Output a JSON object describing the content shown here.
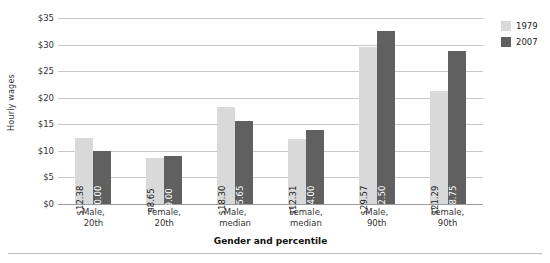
{
  "chart_data": {
    "type": "bar",
    "title": "",
    "xlabel": "Gender and percentile",
    "ylabel": "Hourly wages",
    "ylim": [
      0,
      35
    ],
    "yticks": [
      "$0",
      "$5",
      "$10",
      "$15",
      "$20",
      "$25",
      "$30",
      "$35"
    ],
    "ytick_values": [
      0,
      5,
      10,
      15,
      20,
      25,
      30,
      35
    ],
    "grid": true,
    "legend_position": "top-right",
    "categories": [
      "Male,\n20th",
      "Female,\n20th",
      "Male,\nmedian",
      "Female,\nmedian",
      "Male,\n90th",
      "Female,\n90th"
    ],
    "category_lines": [
      [
        "Male,",
        "20th"
      ],
      [
        "Female,",
        "20th"
      ],
      [
        "Male,",
        "median"
      ],
      [
        "Female,",
        "median"
      ],
      [
        "Male,",
        "90th"
      ],
      [
        "Female,",
        "90th"
      ]
    ],
    "series": [
      {
        "name": "1979",
        "color": "#d9d9d9",
        "values": [
          12.38,
          8.65,
          18.3,
          12.31,
          29.57,
          21.29
        ],
        "labels": [
          "$12.38",
          "$8.65",
          "$18.30",
          "$12.31",
          "$29.57",
          "$21.29"
        ]
      },
      {
        "name": "2007",
        "color": "#606060",
        "values": [
          10.0,
          9.0,
          15.65,
          14.0,
          32.5,
          28.75
        ],
        "labels": [
          "$10.00",
          "$9.00",
          "$15.65",
          "$14.00",
          "$32.50",
          "$28.75"
        ]
      }
    ]
  },
  "legend": {
    "items": [
      {
        "label": "1979",
        "color": "#d9d9d9"
      },
      {
        "label": "2007",
        "color": "#606060"
      }
    ]
  },
  "axes": {
    "y_title": "Hourly wages",
    "x_title": "Gender and percentile"
  }
}
